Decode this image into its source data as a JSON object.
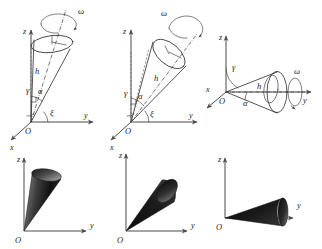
{
  "figure": {
    "background_color": "#ffffff",
    "line_color": "#2b2b2b",
    "fill_color": "#151515",
    "panel_count": 6,
    "rows": 2,
    "columns": 3
  },
  "symbols": {
    "z": "z",
    "y": "y",
    "x": "x",
    "origin": "O",
    "omega": "ω",
    "height": "h",
    "gamma": "γ",
    "alpha": "α",
    "xi": "ξ"
  },
  "panels": [
    {
      "id": "panel-top-left",
      "row": "top",
      "column": 1,
      "kind": "wireframe",
      "description": "Steeply inclined cone with apex at origin, axis near vertical z, spin vector omega about cone axis",
      "labels": {
        "z_axis": "z",
        "y_axis": "y",
        "x_axis": "x",
        "origin": "O",
        "omega": "ω",
        "height": "h",
        "gamma": "γ",
        "alpha": "α",
        "xi": "ξ"
      }
    },
    {
      "id": "panel-top-middle",
      "row": "top",
      "column": 2,
      "kind": "wireframe",
      "description": "Intermediate inclined cone with apex at origin, axis tilted about 45 degrees, spin vector omega about cone axis",
      "labels": {
        "z_axis": "z",
        "y_axis": "y",
        "x_axis": "x",
        "origin": "O",
        "omega": "ω",
        "height": "h",
        "gamma": "γ",
        "alpha": "α",
        "xi": "ξ"
      }
    },
    {
      "id": "panel-top-right",
      "row": "top",
      "column": 3,
      "kind": "wireframe",
      "description": "Nearly horizontal cone with apex at origin, axis along y, spin vector omega about the y direction",
      "labels": {
        "z_axis": "z",
        "y_axis": "y",
        "x_axis": "x",
        "origin": "O",
        "omega": "ω",
        "height": "h",
        "gamma": "γ",
        "alpha": "α"
      }
    },
    {
      "id": "panel-bottom-left",
      "row": "bottom",
      "column": 1,
      "kind": "shaded",
      "description": "Shaded rendering of the steeply inclined cone in the z-y plane",
      "labels": {
        "z_axis": "z",
        "y_axis": "y",
        "origin": "O"
      }
    },
    {
      "id": "panel-bottom-middle",
      "row": "bottom",
      "column": 2,
      "kind": "shaded",
      "description": "Shaded rendering of the intermediate inclined cone in the z-y plane",
      "labels": {
        "z_axis": "z",
        "y_axis": "y",
        "origin": "O"
      }
    },
    {
      "id": "panel-bottom-right",
      "row": "bottom",
      "column": 3,
      "kind": "shaded",
      "description": "Shaded rendering of the nearly horizontal cone in the z-y plane",
      "labels": {
        "z_axis": "z",
        "y_axis": "y",
        "origin": "O"
      }
    }
  ]
}
